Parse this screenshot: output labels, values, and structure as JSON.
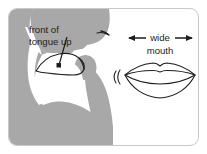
{
  "figure": {
    "background_color": "#ffffff",
    "card_border_color": "#c9c9c9",
    "head_fill_color": "#a8a8a8",
    "cavity_fill_color": "#ffffff",
    "outline_color": "#1d1d1d",
    "text_color": "#1d1d1d"
  },
  "annotations": {
    "tongue_label_line1": "front of",
    "tongue_label_line2": "tongue up",
    "mouth_label_line1": "wide",
    "mouth_label_line2": "mouth"
  },
  "icons": {
    "left_arrow": "left-arrow-icon",
    "right_arrow": "right-arrow-icon",
    "leader_line": "leader-line-icon",
    "tongue_marker": "tongue-marker-icon",
    "lips": "lips-icon",
    "head_profile": "head-profile-icon",
    "nostril": "nostril-icon",
    "width_bracket_left": "bracket-left-icon",
    "width_bracket_right": "bracket-right-icon"
  }
}
